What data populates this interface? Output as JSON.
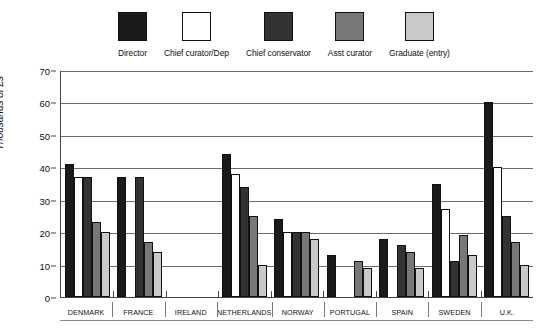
{
  "chart_data": {
    "type": "bar",
    "title": "",
    "xlabel": "",
    "ylabel": "Thousands of £s",
    "ylim": [
      0,
      70
    ],
    "ytick_step": 10,
    "yticks": [
      0,
      10,
      20,
      30,
      40,
      50,
      60,
      70
    ],
    "grid": true,
    "legend_position": "top",
    "categories": [
      "DENMARK",
      "FRANCE",
      "IRELAND",
      "NETHERLANDS",
      "NORWAY",
      "PORTUGAL",
      "SPAIN",
      "SWEDEN",
      "U.K."
    ],
    "series": [
      {
        "name": "Director",
        "color": "#1a1a1a",
        "values": [
          41,
          37,
          null,
          44,
          24,
          13,
          18,
          35,
          60
        ]
      },
      {
        "name": "Chief curator/Dep",
        "color": "#ffffff",
        "values": [
          37,
          null,
          null,
          38,
          20,
          null,
          null,
          27,
          40
        ]
      },
      {
        "name": "Chief conservator",
        "color": "#333333",
        "values": [
          37,
          37,
          null,
          34,
          20,
          null,
          16,
          11,
          25
        ]
      },
      {
        "name": "Asst curator",
        "color": "#787878",
        "values": [
          23,
          17,
          null,
          25,
          20,
          11,
          14,
          19,
          17
        ]
      },
      {
        "name": "Graduate (entry)",
        "color": "#c9c9c9",
        "values": [
          20,
          14,
          null,
          10,
          18,
          9,
          9,
          13,
          10
        ]
      }
    ]
  },
  "legend": {
    "items": [
      {
        "label": "Director",
        "color": "#1a1a1a"
      },
      {
        "label": "Chief curator/Dep",
        "color": "#ffffff"
      },
      {
        "label": "Chief conservator",
        "color": "#333333"
      },
      {
        "label": "Asst curator",
        "color": "#787878"
      },
      {
        "label": "Graduate (entry)",
        "color": "#c9c9c9"
      }
    ]
  },
  "axes": {
    "y_title": "Thousands of £s",
    "y_tick_labels": [
      "70",
      "60",
      "50",
      "40",
      "30",
      "20",
      "10",
      "0"
    ]
  }
}
